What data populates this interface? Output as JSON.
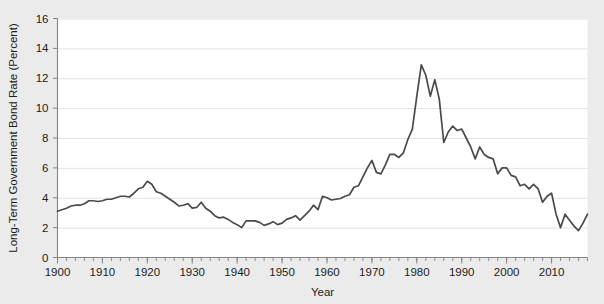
{
  "chart_data": {
    "type": "line",
    "title": "",
    "xlabel": "Year",
    "ylabel": "Long-Term Government Bond Rate (Percent)",
    "xlim": [
      1900,
      2018
    ],
    "ylim": [
      0,
      16
    ],
    "xticks": [
      1900,
      1910,
      1920,
      1930,
      1940,
      1950,
      1960,
      1970,
      1980,
      1990,
      2000,
      2010
    ],
    "yticks": [
      0,
      2,
      4,
      6,
      8,
      10,
      12,
      14,
      16
    ],
    "xtick_labels": [
      "1900",
      "1910",
      "1920",
      "1930",
      "1940",
      "1950",
      "1960",
      "1970",
      "1980",
      "1990",
      "2000",
      "2010"
    ],
    "ytick_labels": [
      "0",
      "2",
      "4",
      "6",
      "8",
      "10",
      "12",
      "14",
      "16"
    ],
    "xtick_minor_interval": 2,
    "grid": "horizontal",
    "legend": "none",
    "line_color": "#4a4a4a",
    "plot_background": "#ffffff",
    "figure_background": "#ebebeb",
    "series": [
      {
        "name": "Long-Term Government Bond Rate",
        "x": [
          1900,
          1901,
          1902,
          1903,
          1904,
          1905,
          1906,
          1907,
          1908,
          1909,
          1910,
          1911,
          1912,
          1913,
          1914,
          1915,
          1916,
          1917,
          1918,
          1919,
          1920,
          1921,
          1922,
          1923,
          1924,
          1925,
          1926,
          1927,
          1928,
          1929,
          1930,
          1931,
          1932,
          1933,
          1934,
          1935,
          1936,
          1937,
          1938,
          1939,
          1940,
          1941,
          1942,
          1943,
          1944,
          1945,
          1946,
          1947,
          1948,
          1949,
          1950,
          1951,
          1952,
          1953,
          1954,
          1955,
          1956,
          1957,
          1958,
          1959,
          1960,
          1961,
          1962,
          1963,
          1964,
          1965,
          1966,
          1967,
          1968,
          1969,
          1970,
          1971,
          1972,
          1973,
          1974,
          1975,
          1976,
          1977,
          1978,
          1979,
          1980,
          1981,
          1982,
          1983,
          1984,
          1985,
          1986,
          1987,
          1988,
          1989,
          1990,
          1991,
          1992,
          1993,
          1994,
          1995,
          1996,
          1997,
          1998,
          1999,
          2000,
          2001,
          2002,
          2003,
          2004,
          2005,
          2006,
          2007,
          2008,
          2009,
          2010,
          2011,
          2012,
          2013,
          2014,
          2015,
          2016,
          2017,
          2018
        ],
        "values": [
          3.1,
          3.2,
          3.3,
          3.45,
          3.5,
          3.5,
          3.6,
          3.8,
          3.8,
          3.75,
          3.8,
          3.9,
          3.9,
          4.0,
          4.1,
          4.1,
          4.05,
          4.3,
          4.6,
          4.7,
          5.1,
          4.9,
          4.4,
          4.3,
          4.1,
          3.9,
          3.7,
          3.45,
          3.5,
          3.6,
          3.3,
          3.35,
          3.7,
          3.3,
          3.1,
          2.8,
          2.65,
          2.7,
          2.55,
          2.35,
          2.2,
          2.0,
          2.45,
          2.45,
          2.45,
          2.35,
          2.15,
          2.25,
          2.4,
          2.2,
          2.3,
          2.55,
          2.65,
          2.8,
          2.5,
          2.8,
          3.1,
          3.5,
          3.2,
          4.1,
          4.0,
          3.85,
          3.9,
          3.95,
          4.1,
          4.2,
          4.7,
          4.8,
          5.4,
          6.0,
          6.5,
          5.7,
          5.6,
          6.2,
          6.9,
          6.9,
          6.7,
          7.0,
          7.9,
          8.6,
          10.8,
          12.9,
          12.2,
          10.8,
          11.9,
          10.6,
          7.7,
          8.4,
          8.8,
          8.5,
          8.6,
          8.0,
          7.4,
          6.6,
          7.4,
          6.9,
          6.7,
          6.6,
          5.6,
          6.0,
          6.0,
          5.5,
          5.4,
          4.8,
          4.9,
          4.6,
          4.9,
          4.6,
          3.7,
          4.1,
          4.3,
          2.9,
          2.0,
          2.9,
          2.5,
          2.1,
          1.8,
          2.3,
          2.9
        ]
      }
    ]
  },
  "axis_labels": {
    "x_title": "Year",
    "y_title": "Long-Term Government Bond Rate (Percent)"
  }
}
